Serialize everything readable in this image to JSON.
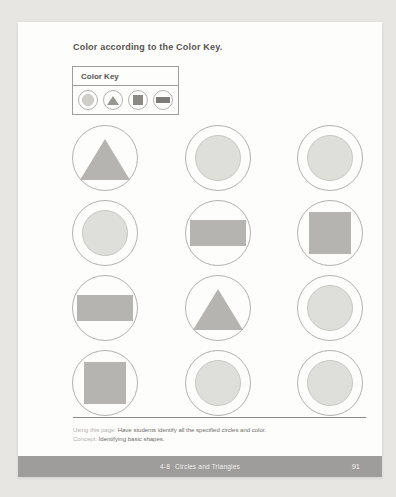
{
  "instruction": "Color according to the Color Key.",
  "color_key": {
    "label": "Color Key",
    "items": [
      {
        "shape": "circle"
      },
      {
        "shape": "triangle"
      },
      {
        "shape": "square"
      },
      {
        "shape": "rectangle"
      }
    ]
  },
  "grid": {
    "rows": 4,
    "cols": 3,
    "cells": [
      {
        "shape": "triangle"
      },
      {
        "shape": "circle"
      },
      {
        "shape": "circle"
      },
      {
        "shape": "circle"
      },
      {
        "shape": "rectangle"
      },
      {
        "shape": "square"
      },
      {
        "shape": "rectangle"
      },
      {
        "shape": "triangle"
      },
      {
        "shape": "circle"
      },
      {
        "shape": "square"
      },
      {
        "shape": "circle"
      },
      {
        "shape": "circle"
      }
    ]
  },
  "footer": {
    "using_label": "Using this page:",
    "using_text": "Have students identify all the specified circles and color.",
    "concept_label": "Concept:",
    "concept_text": "Identifying basic shapes."
  },
  "footer_bar": {
    "lesson_number": "4-8",
    "lesson_title": "Circles and Triangles",
    "page_number": "91"
  },
  "colors": {
    "background": "#e7e6e3",
    "page": "#fdfdfc",
    "text_dark": "#55544f",
    "outline": "#b3b2ae",
    "box_border": "#9f9e9a",
    "light_fill": "#dededa",
    "light_border": "#c8c7c2",
    "gray_fill": "#b5b4b0",
    "key_circle_fill": "#cfcec9",
    "key_triangle_fill": "#98978f",
    "key_square_fill": "#8b8a85",
    "key_rect_fill": "#7c7b76",
    "rule": "#8a8984",
    "footer_label": "#b3b2ad",
    "footer_text": "#6e6d68",
    "bar_bg": "#9e9d9b",
    "bar_text": "#f2f1ef"
  }
}
